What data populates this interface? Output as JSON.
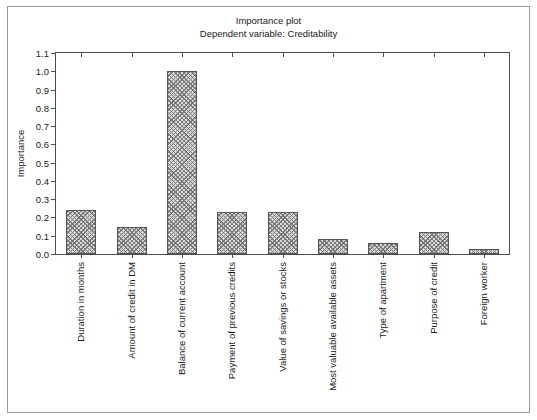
{
  "chart_data": {
    "type": "bar",
    "title": "Importance plot",
    "subtitle": "Dependent variable: Creditability",
    "xlabel": "",
    "ylabel": "Importance",
    "ylim": [
      0.0,
      1.1
    ],
    "ytick_labels": [
      "0.0",
      "0.1",
      "0.2",
      "0.3",
      "0.4",
      "0.5",
      "0.6",
      "0.7",
      "0.8",
      "0.9",
      "1.0",
      "1.1"
    ],
    "ytick_values": [
      0.0,
      0.1,
      0.2,
      0.3,
      0.4,
      0.5,
      0.6,
      0.7,
      0.8,
      0.9,
      1.0,
      1.1
    ],
    "grid": false,
    "legend": "none",
    "categories": [
      "Duration in months",
      "Amount of credit in DM",
      "Balance of current account",
      "Payment of previous credits",
      "Value of savings or stocks",
      "Most valuable available assets",
      "Type of apartment",
      "Purpose of credit",
      "Foreign worker"
    ],
    "values": [
      0.24,
      0.15,
      1.0,
      0.23,
      0.23,
      0.08,
      0.06,
      0.12,
      0.03
    ],
    "bar_fill": "#d8d8d8",
    "bar_hatch": "crosshatch",
    "bar_edge_color": "#555555",
    "axis_color": "#4d4d4d",
    "background": "#ffffff",
    "frame_color": "#9a9a9a"
  }
}
